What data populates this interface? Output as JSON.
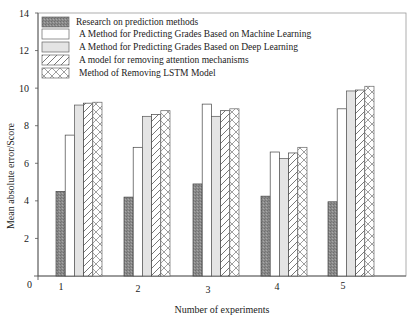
{
  "chart_data": {
    "type": "bar",
    "title": "",
    "xlabel": "Number of experiments",
    "ylabel": "Mean absolute error/Score",
    "ylim": [
      0,
      14
    ],
    "yticks": [
      0,
      2,
      4,
      6,
      8,
      10,
      12,
      14
    ],
    "grid": false,
    "legend_position": "upper-left inside",
    "categories": [
      "1",
      "2",
      "3",
      "4",
      "5"
    ],
    "series": [
      {
        "name": "Research on prediction methods",
        "pattern": "dark-dotted",
        "values": [
          4.5,
          4.2,
          4.9,
          4.25,
          3.95
        ]
      },
      {
        "name": "A Method for Predicting Grades Based on Machine Learning",
        "pattern": "white",
        "values": [
          7.5,
          6.85,
          9.15,
          6.6,
          8.9
        ]
      },
      {
        "name": "A Method for Predicting Grades Based on Deep Learning",
        "pattern": "light-gray",
        "values": [
          9.1,
          8.5,
          8.5,
          6.25,
          9.85
        ]
      },
      {
        "name": "A model for removing attention mechanisms",
        "pattern": "diagonal-hatch",
        "values": [
          9.2,
          8.6,
          8.8,
          6.55,
          9.9
        ]
      },
      {
        "name": "Method of Removing LSTM Model",
        "pattern": "cross-hatch",
        "values": [
          9.25,
          8.8,
          8.9,
          6.85,
          10.1
        ]
      }
    ]
  },
  "colors": {
    "dark_bar": "#8c8c8c",
    "light_bar": "#e4e4e4",
    "axis": "#555555"
  }
}
